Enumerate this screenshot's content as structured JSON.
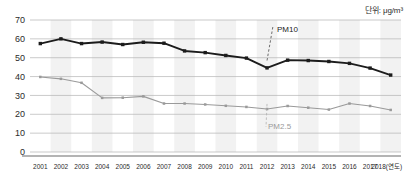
{
  "unit": {
    "label": "단위: μg/m³"
  },
  "annotations": {
    "pm10_label": "PM10",
    "pm25_label": "PM2.5"
  },
  "axis": {
    "x_suffix_label": "(연도)"
  },
  "colors": {
    "pm10_line": "#1c1c1c",
    "pm25_line": "#9a9a9a",
    "gridline": "#b3b3b3",
    "band": "#f2f2f2",
    "axis": "#6b6b6b",
    "text": "#2b2b2b"
  },
  "chart_data": {
    "type": "line",
    "title": "",
    "subtitle": "",
    "xlabel": "(연도)",
    "ylabel": "",
    "unit": "μg/m³",
    "ylim": [
      0,
      70
    ],
    "yticks": [
      0,
      10,
      20,
      30,
      40,
      50,
      60,
      70
    ],
    "grid": true,
    "legend": "annotation-callout",
    "categories": [
      "2001",
      "2002",
      "2003",
      "2004",
      "2005",
      "2006",
      "2007",
      "2008",
      "2009",
      "2010",
      "2011",
      "2012",
      "2013",
      "2014",
      "2015",
      "2016",
      "2017",
      "2018"
    ],
    "series": [
      {
        "name": "PM10",
        "color": "#1c1c1c",
        "values": [
          57.5,
          60.0,
          57.5,
          58.3,
          57.0,
          58.2,
          57.7,
          53.6,
          52.7,
          51.2,
          49.8,
          44.6,
          48.7,
          48.5,
          48.0,
          47.0,
          44.5,
          40.8
        ]
      },
      {
        "name": "PM2.5",
        "color": "#9a9a9a",
        "values": [
          39.8,
          38.8,
          36.7,
          28.7,
          28.8,
          29.5,
          25.7,
          25.7,
          25.2,
          24.5,
          23.9,
          22.8,
          24.4,
          23.5,
          22.5,
          25.7,
          24.4,
          22.3
        ]
      }
    ]
  }
}
